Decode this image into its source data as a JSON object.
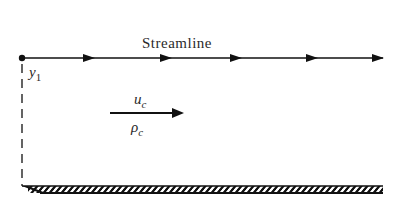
{
  "diagram": {
    "streamline_label": "Streamline",
    "point_label": {
      "base": "y",
      "sub": "1"
    },
    "velocity_label": {
      "base": "u",
      "sub": "c"
    },
    "density_label": {
      "base": "ρ",
      "sub": "c"
    },
    "colors": {
      "ink": "#111111",
      "text": "#2a2a2a",
      "background": "#ffffff"
    }
  }
}
